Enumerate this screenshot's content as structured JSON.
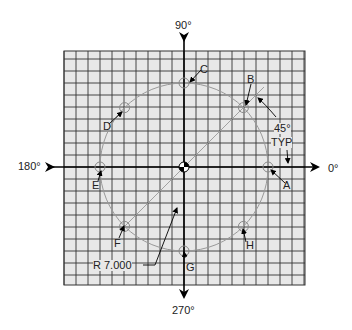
{
  "diagram": {
    "axes": {
      "deg_0": "0°",
      "deg_90": "90°",
      "deg_180": "180°",
      "deg_270": "270°"
    },
    "holes": [
      {
        "id": "A",
        "label": "A",
        "angle_deg": 0
      },
      {
        "id": "B",
        "label": "B",
        "angle_deg": 45
      },
      {
        "id": "C",
        "label": "C",
        "angle_deg": 90
      },
      {
        "id": "D",
        "label": "D",
        "angle_deg": 135
      },
      {
        "id": "E",
        "label": "E",
        "angle_deg": 180
      },
      {
        "id": "F",
        "label": "F",
        "angle_deg": 225
      },
      {
        "id": "G",
        "label": "G",
        "angle_deg": 270
      },
      {
        "id": "H",
        "label": "H",
        "angle_deg": 315
      }
    ],
    "angle_note_line1": "45°",
    "angle_note_line2": "TYP",
    "radius_note": "R 7.000",
    "colors": {
      "grid_fill": "#e8e8e8",
      "grid_line": "#333333",
      "circle": "#999999",
      "axis": "#000000"
    }
  }
}
